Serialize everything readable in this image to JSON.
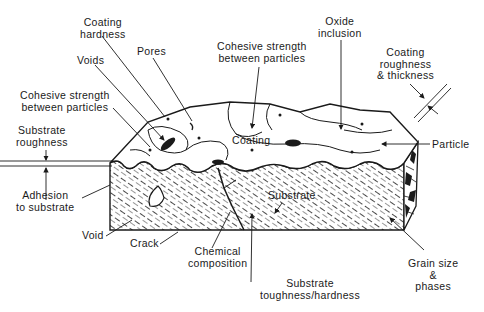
{
  "diagram": {
    "labels": {
      "coating_hardness": [
        "Coating",
        "hardness"
      ],
      "pores": [
        "Pores"
      ],
      "voids": [
        "Voids"
      ],
      "cohesive_left": [
        "Cohesive strength",
        "between particles"
      ],
      "cohesive_top": [
        "Cohesive strength",
        "between particles"
      ],
      "oxide_inclusion": [
        "Oxide",
        "inclusion"
      ],
      "coating_roughness": [
        "Coating",
        "roughness",
        "& thickness"
      ],
      "substrate_roughness": [
        "Substrate",
        "roughness"
      ],
      "coating": [
        "Coating"
      ],
      "particle": [
        "Particle"
      ],
      "adhesion": [
        "Adhesion",
        "to substrate"
      ],
      "substrate": [
        "Substrate"
      ],
      "void": [
        "Void"
      ],
      "crack": [
        "Crack"
      ],
      "chemical_composition": [
        "Chemical",
        "composition"
      ],
      "substrate_toughness": [
        "Substrate",
        "toughness/hardness"
      ],
      "grain_size": [
        "Grain size",
        "&",
        "phases"
      ]
    },
    "colors": {
      "ink": "#1a1a1a",
      "background": "#ffffff"
    }
  }
}
